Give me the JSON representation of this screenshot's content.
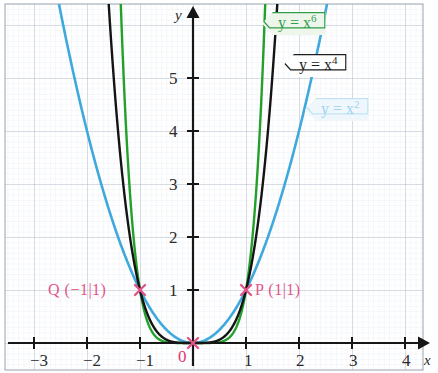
{
  "chart_data": {
    "type": "line",
    "title": "",
    "xlabel": "x",
    "ylabel": "y",
    "xlim": [
      -3.64,
      4.24
    ],
    "ylim": [
      -0.55,
      6.4
    ],
    "grid": true,
    "grid_minor_step": 0.1,
    "grid_major_step": 1,
    "x_ticks": [
      -3,
      -2,
      -1,
      0,
      1,
      2,
      3,
      4
    ],
    "x_tick_labels": [
      "−3",
      "−2",
      "−1",
      "0",
      "1",
      "2",
      "3",
      "4"
    ],
    "y_ticks": [
      1,
      2,
      3,
      4,
      5
    ],
    "y_tick_labels": [
      "1",
      "2",
      "3",
      "4",
      "5"
    ],
    "legend_position": "inside-top-right",
    "series": [
      {
        "name": "y = x²",
        "expression": "y = x^2",
        "color": "#3fa8dd",
        "exponent": 2,
        "label_text": "y = x",
        "label_sup": "2"
      },
      {
        "name": "y = x⁴",
        "expression": "y = x^4",
        "color": "#141414",
        "exponent": 4,
        "label_text": "y = x",
        "label_sup": "4"
      },
      {
        "name": "y = x⁶",
        "expression": "y = x^6",
        "color": "#22a02a",
        "exponent": 6,
        "label_text": "y = x",
        "label_sup": "6"
      }
    ],
    "annotations": [
      {
        "name": "P",
        "label": "P (1|1)",
        "x": 1,
        "y": 1,
        "marker": "x",
        "color": "#e3548a"
      },
      {
        "name": "Q",
        "label": "Q (−1|1)",
        "x": -1,
        "y": 1,
        "marker": "x",
        "color": "#e3548a"
      },
      {
        "name": "O",
        "label": "0",
        "x": 0,
        "y": 0,
        "marker": "x",
        "color": "#e53274"
      }
    ]
  },
  "axes": {
    "x_axis_name": "x",
    "y_axis_name": "y",
    "origin_label": "0",
    "x_ticks": [
      {
        "label": "−3",
        "left": 30,
        "top": 352
      },
      {
        "label": "−2",
        "left": 83,
        "top": 352
      },
      {
        "label": "−1",
        "left": 136,
        "top": 352
      },
      {
        "label": "1",
        "left": 244,
        "top": 352
      },
      {
        "label": "2",
        "left": 296,
        "top": 352
      },
      {
        "label": "3",
        "left": 349,
        "top": 352
      },
      {
        "label": "4",
        "left": 402,
        "top": 352
      }
    ],
    "y_ticks": [
      {
        "label": "5",
        "left": 168,
        "top": 71
      },
      {
        "label": "4",
        "left": 168,
        "top": 124
      },
      {
        "label": "3",
        "left": 168,
        "top": 177
      },
      {
        "label": "2",
        "left": 168,
        "top": 230
      },
      {
        "label": "1",
        "left": 168,
        "top": 283
      }
    ]
  },
  "colors": {
    "curve_x2": "#3fa8dd",
    "curve_x4": "#141414",
    "curve_x6": "#22a02a",
    "annotation_pink": "#e3548a",
    "origin_pink": "#e53274",
    "axis": "#161616",
    "grid_minor": "#dfe4ee",
    "grid_major": "#aeb6c6",
    "frame": "#8e96a6"
  }
}
